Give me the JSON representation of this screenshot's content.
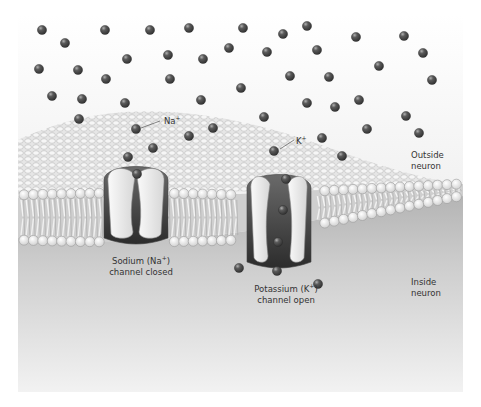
{
  "figure": {
    "colors": {
      "outside_top": "#ffffff",
      "outside_bottom": "#e6e6e6",
      "inside_top": "#b8b8b8",
      "inside_bottom": "#efefef",
      "ion_fill": "#4a4a4a",
      "ion_highlight": "#9a9a9a",
      "channel_dark": "#5a5a5a",
      "channel_light": "#ececec",
      "head_fill": "#f4f4f4",
      "head_stroke": "#9c9c9c",
      "tail": "#d8d8d8"
    },
    "labels": {
      "na_ion": "Na",
      "na_ion_sup": "+",
      "k_ion": "K",
      "k_ion_sup": "+",
      "sodium_channel_line1_a": "Sodium (Na",
      "sodium_channel_line1_sup": "+",
      "sodium_channel_line1_b": ")",
      "sodium_channel_line2": "channel closed",
      "potassium_channel_line1_a": "Potassium (K",
      "potassium_channel_line1_sup": "+",
      "potassium_channel_line1_b": ")",
      "potassium_channel_line2": "channel open",
      "outside_line1": "Outside",
      "outside_line2": "neuron",
      "inside_line1": "Inside",
      "inside_line2": "neuron"
    },
    "ions_outside": [
      [
        42,
        30
      ],
      [
        65,
        43
      ],
      [
        105,
        30
      ],
      [
        150,
        30
      ],
      [
        189,
        28
      ],
      [
        243,
        28
      ],
      [
        283,
        34
      ],
      [
        307,
        26
      ],
      [
        356,
        37
      ],
      [
        404,
        36
      ],
      [
        39,
        69
      ],
      [
        78,
        70
      ],
      [
        127,
        59
      ],
      [
        168,
        55
      ],
      [
        203,
        59
      ],
      [
        229,
        48
      ],
      [
        267,
        52
      ],
      [
        317,
        50
      ],
      [
        379,
        66
      ],
      [
        423,
        53
      ],
      [
        106,
        79
      ],
      [
        170,
        79
      ],
      [
        241,
        88
      ],
      [
        290,
        76
      ],
      [
        329,
        77
      ],
      [
        432,
        80
      ],
      [
        52,
        96
      ],
      [
        82,
        99
      ],
      [
        125,
        103
      ],
      [
        201,
        100
      ],
      [
        307,
        103
      ],
      [
        335,
        107
      ],
      [
        359,
        100
      ],
      [
        79,
        119
      ],
      [
        264,
        117
      ],
      [
        406,
        116
      ],
      [
        367,
        129
      ],
      [
        419,
        133
      ]
    ],
    "ions_membrane": [
      [
        136,
        129
      ],
      [
        153,
        148
      ],
      [
        189,
        136
      ],
      [
        213,
        128
      ],
      [
        274,
        151
      ],
      [
        322,
        138
      ],
      [
        342,
        156
      ],
      [
        128,
        157
      ]
    ],
    "ions_channel": [
      [
        137,
        174
      ],
      [
        286,
        179
      ],
      [
        283,
        210
      ],
      [
        278,
        242
      ]
    ],
    "ions_inside": [
      [
        239,
        268
      ],
      [
        277,
        271
      ],
      [
        318,
        284
      ]
    ]
  }
}
